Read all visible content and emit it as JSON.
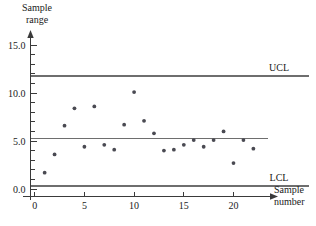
{
  "chart_data": {
    "type": "scatter",
    "title": "",
    "xlabel": "Sample number",
    "ylabel": "Sample range",
    "xlim": [
      -1,
      23.5
    ],
    "ylim": [
      0,
      16
    ],
    "grid": false,
    "legend_position": "inline-right",
    "x": [
      1,
      2,
      3,
      4,
      5,
      6,
      7,
      8,
      9,
      10,
      11,
      12,
      13,
      14,
      15,
      16,
      17,
      18,
      19,
      20,
      21,
      22
    ],
    "values": [
      1.7,
      3.6,
      6.6,
      8.4,
      4.4,
      8.6,
      4.6,
      4.1,
      6.7,
      10.1,
      7.1,
      5.8,
      4.0,
      4.1,
      4.6,
      5.1,
      4.4,
      5.1,
      6.0,
      2.7,
      5.1,
      4.2
    ],
    "series": [
      {
        "name": "Sample range",
        "values": [
          1.7,
          3.6,
          6.6,
          8.4,
          4.4,
          8.6,
          4.6,
          4.1,
          6.7,
          10.1,
          7.1,
          5.8,
          4.0,
          4.1,
          4.6,
          5.1,
          4.4,
          5.1,
          6.0,
          2.7,
          5.1,
          4.2
        ]
      }
    ],
    "reference_lines": [
      {
        "label": "UCL",
        "value": 11.8
      },
      {
        "label": "",
        "value": 5.25
      },
      {
        "label": "LCL",
        "value": 0.3
      }
    ],
    "ytick_labels": [
      "15.0",
      "10.0",
      "5.0",
      "0.0"
    ],
    "ytick_values": [
      15.0,
      10.0,
      5.0,
      0.0
    ],
    "yminor_values": [
      14,
      13,
      12,
      11,
      9,
      8,
      7,
      6,
      4,
      3,
      2,
      1
    ],
    "xtick_labels": [
      "0",
      "5",
      "10",
      "15",
      "20"
    ],
    "xtick_values": [
      0,
      5,
      10,
      15,
      20
    ]
  },
  "labels": {
    "y_axis_line1": "Sample",
    "y_axis_line2": "range",
    "x_axis_line1": "Sample",
    "x_axis_line2": "number",
    "ucl": "UCL",
    "lcl": "LCL"
  },
  "colors": {
    "axis": "#3a3a3a",
    "control_line": "#6e6e6e",
    "marker": "#4a4a52",
    "text": "#1a1a1a",
    "background": "#ffffff"
  }
}
